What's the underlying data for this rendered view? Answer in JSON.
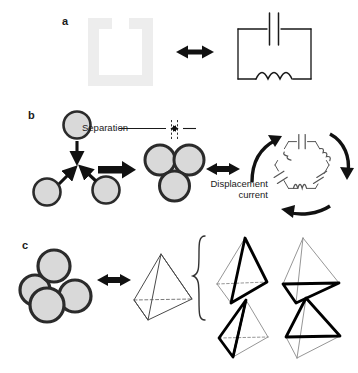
{
  "figure": {
    "width": 358,
    "height": 373,
    "background": "#ffffff",
    "ink": "#1a1a1a",
    "sphere_fill": "#d9d9d9",
    "sphere_stroke": "#2b2b2b",
    "ring_color": "#ededed",
    "circuit_stroke": "#1a1a1a",
    "bold_edge_color": "#000000",
    "thin_edge_color": "#5a5a5a",
    "dashed_edge_color": "#7a7a7a"
  },
  "panels": [
    {
      "id": "a",
      "label": "a",
      "label_x": 62,
      "label_y": 18,
      "description": "split-ring resonator equivalent to an LC circuit",
      "items": {
        "split_ring": {
          "name": "split-ring-resonator",
          "gap_position": "top-center",
          "color": "#ededed"
        },
        "arrow": {
          "name": "double-headed-arrow",
          "direction": "horizontal"
        },
        "circuit": {
          "name": "lc-circuit",
          "components": [
            "capacitor",
            "inductor"
          ],
          "capacitor_position": "top",
          "inductor_position": "bottom",
          "inductor_loops": 3
        }
      }
    },
    {
      "id": "b",
      "label": "b",
      "label_x": 28,
      "label_y": 112,
      "description": "three spheres assemble into a trimer, equivalent to a hexagonal LC ring carrying displacement current",
      "items": {
        "loose_spheres": {
          "name": "loose-sphere-group",
          "count": 3
        },
        "assembly_arrows": {
          "name": "assembly-arrow",
          "count": 3
        },
        "big_arrow": {
          "name": "process-arrow",
          "direction": "right"
        },
        "trimer": {
          "name": "sphere-trimer",
          "count": 3
        },
        "equivalence_arrow": {
          "name": "double-headed-arrow",
          "direction": "horizontal"
        },
        "hex_circuit": {
          "name": "hexagonal-lc-circuit",
          "capacitors": 3,
          "inductors": 3
        },
        "current_arrows": {
          "name": "circulating-current-arrow",
          "count": 3
        }
      },
      "annotations": {
        "separation": "Separation",
        "displacement_line1": "Displacement",
        "displacement_line2": "current"
      }
    },
    {
      "id": "c",
      "label": "c",
      "label_x": 22,
      "label_y": 242,
      "description": "tetramer cluster equivalent to a tetrahedron; brace expands to four tetrahedra each highlighting one face",
      "items": {
        "tetramer": {
          "name": "sphere-tetramer",
          "count": 4
        },
        "equivalence_arrow": {
          "name": "double-headed-arrow",
          "direction": "horizontal"
        },
        "tetrahedron": {
          "name": "tetrahedron"
        },
        "brace": {
          "name": "curly-brace",
          "orientation": "left"
        },
        "face_variants": [
          {
            "name": "tetrahedron-face-right",
            "highlighted_face": "right"
          },
          {
            "name": "tetrahedron-face-bottom",
            "highlighted_face": "bottom"
          },
          {
            "name": "tetrahedron-face-left",
            "highlighted_face": "left"
          },
          {
            "name": "tetrahedron-face-front",
            "highlighted_face": "front"
          }
        ]
      }
    }
  ]
}
